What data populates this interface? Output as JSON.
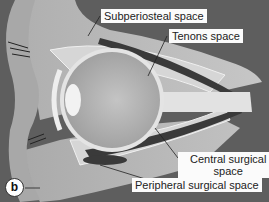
{
  "figure": {
    "panel_label": "b",
    "labels": [
      {
        "id": "subperiosteal",
        "text": "Subperiosteal space"
      },
      {
        "id": "tenons",
        "text": "Tenons space"
      },
      {
        "id": "central_surgical",
        "line1": "Central surgical",
        "line2": "space"
      },
      {
        "id": "peripheral_surgical",
        "text": "Peripheral surgical space"
      }
    ]
  },
  "colors": {
    "background": "#5e5e5e",
    "bone": "#c9c9c9",
    "tissue": "#d8d8d8",
    "globe": "#b4b4b4",
    "muscle": "#3a3a3a",
    "label_bg": "#fbfbfb"
  }
}
